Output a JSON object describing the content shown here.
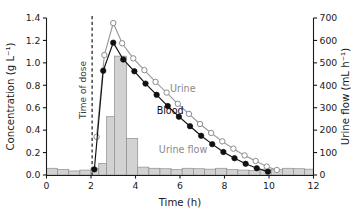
{
  "chart_data": {
    "type": "line",
    "title": "",
    "xlabel": "Time (h)",
    "ylabel": "Concentration (g L⁻¹)",
    "y2label": "Urine flow (mL h⁻¹)",
    "xlim": [
      0,
      12
    ],
    "ylim": [
      0.0,
      1.4
    ],
    "y2lim": [
      0,
      700
    ],
    "xticks": [
      0,
      2,
      4,
      6,
      8,
      10,
      12
    ],
    "xticklabels": [
      "0",
      "2",
      "4",
      "6",
      "8",
      "10",
      "12"
    ],
    "yticks": [
      0.0,
      0.2,
      0.4,
      0.6,
      0.8,
      1.0,
      1.2,
      1.4
    ],
    "yticklabels": [
      "0.0",
      "0.2",
      "0.4",
      "0.6",
      "0.8",
      "1.0",
      "1.2",
      "1.4"
    ],
    "y2ticks": [
      0,
      100,
      200,
      300,
      400,
      500,
      600,
      700
    ],
    "y2ticklabels": [
      "0",
      "100",
      "200",
      "300",
      "400",
      "500",
      "600",
      "700"
    ],
    "grid": false,
    "legend_position": "inline-annotations",
    "annotations": [
      {
        "name": "time-of-dose",
        "text": "Time of dose",
        "x": 2.05,
        "rotation": -90,
        "color": "#3b3b3b"
      },
      {
        "name": "urine-label",
        "text": "Urine",
        "x": 5.55,
        "y": 0.74,
        "color": "#8a8a8a"
      },
      {
        "name": "blood-label",
        "text": "Blood",
        "x": 4.95,
        "y": 0.54,
        "color": "#111111"
      },
      {
        "name": "urine-flow-label",
        "text": "Urine flow",
        "x": 5.05,
        "y": 0.2,
        "color": "#8a8a8a"
      }
    ],
    "dose_marker": {
      "x": 2.05,
      "style": "dashed-vertical"
    },
    "series": [
      {
        "name": "Urine",
        "axis": "left",
        "marker": "open-circle",
        "color": "#9a9a9a",
        "x": [
          2.25,
          2.6,
          3.0,
          3.4,
          3.9,
          4.4,
          4.9,
          5.4,
          5.9,
          6.4,
          6.9,
          7.4,
          7.9,
          8.4,
          8.9,
          9.4,
          9.9,
          10.35
        ],
        "y": [
          0.34,
          1.07,
          1.355,
          1.175,
          1.04,
          0.935,
          0.83,
          0.735,
          0.635,
          0.545,
          0.455,
          0.375,
          0.3,
          0.235,
          0.175,
          0.125,
          0.075,
          0.045
        ]
      },
      {
        "name": "Blood",
        "axis": "left",
        "marker": "filled-circle",
        "color": "#111111",
        "x": [
          2.15,
          2.55,
          3.0,
          3.45,
          3.95,
          4.45,
          4.95,
          5.45,
          5.95,
          6.45,
          6.95,
          7.45,
          7.95,
          8.45,
          8.95,
          9.45,
          9.95
        ],
        "y": [
          0.05,
          0.93,
          1.18,
          1.03,
          0.925,
          0.815,
          0.715,
          0.615,
          0.52,
          0.435,
          0.35,
          0.275,
          0.205,
          0.15,
          0.1,
          0.06,
          0.03
        ]
      },
      {
        "name": "Urine flow",
        "axis": "right",
        "type": "bar",
        "color": "#d2d2d2",
        "bin_edges": [
          0.0,
          0.5,
          1.0,
          1.5,
          2.0,
          2.35,
          2.7,
          3.05,
          3.6,
          4.1,
          4.6,
          5.1,
          5.6,
          6.1,
          6.6,
          7.1,
          7.6,
          8.1,
          8.6,
          9.1,
          9.6,
          10.1,
          10.6,
          11.1,
          11.6,
          12.0
        ],
        "values": [
          30,
          25,
          18,
          22,
          30,
          52,
          260,
          530,
          163,
          35,
          30,
          28,
          24,
          30,
          28,
          26,
          30,
          24,
          22,
          20,
          26,
          24,
          30,
          28,
          26
        ]
      }
    ]
  }
}
